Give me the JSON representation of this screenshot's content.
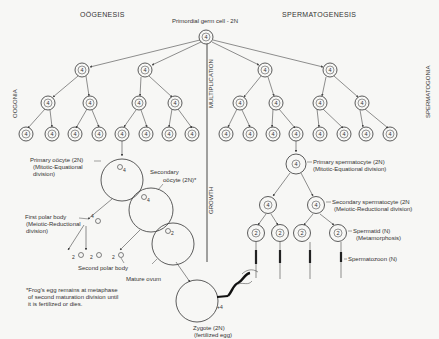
{
  "titles": {
    "oogenesis": "OÖGENESIS",
    "spermatogenesis": "SPERMATOGENESIS",
    "primordial": "Primordial germ cell - 2N"
  },
  "side_labels": {
    "oogonia": "OOGONIA",
    "spermatogonia": "SPERMATOGONIA",
    "multiplication": "MULTIPLICATION",
    "growth": "GROWTH"
  },
  "cell_number": "4",
  "haploid_number": "2",
  "oogenesis_labels": {
    "primary_oocyte_1": "Primary oöcyte (2N)",
    "primary_oocyte_2": "(Mitotic-Equational",
    "primary_oocyte_3": "division)",
    "secondary_oocyte_1": "Secondary",
    "secondary_oocyte_2": "oöcyte (2N)*",
    "first_polar_1": "First polar body",
    "first_polar_2": "(Meiotic-Reductional",
    "first_polar_3": "division)",
    "second_polar": "Second polar body",
    "mature_ovum": "Mature ovum",
    "zygote_1": "Zygote (2N)",
    "zygote_2": "(fertilized egg)",
    "polar_num_4": "4",
    "polar_num_2": "2",
    "nucleus_4": "4",
    "nucleus_2": "2"
  },
  "spermatogenesis_labels": {
    "primary_1": "Primary spermatocyte (2N)",
    "primary_2": "(Mitotic-Equational division)",
    "secondary_1": "Secondary spermatocyte (2N",
    "secondary_2": "(Meiotic-Reductional division)",
    "spermatid_1": "Spermatid (N)",
    "spermatid_2": "(Metamorphosis)",
    "spermatozoon": "Spermatozoon (N)"
  },
  "footnote": {
    "line1": "*Frog's egg remains at metaphase",
    "line2": "of second maturation division until",
    "line3": "it is fertilized or dies."
  }
}
